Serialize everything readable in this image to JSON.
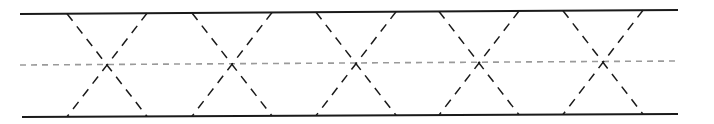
{
  "diagram": {
    "type": "truss-band-pattern",
    "width": 714,
    "height": 124,
    "colors": {
      "boundary": "#1a1a1a",
      "diagonal": "#1a1a1a",
      "centerline": "#9a9a9a",
      "background": "#ffffff"
    },
    "top_line": {
      "x1": 20,
      "y1": 14,
      "x2": 678,
      "y2": 10
    },
    "bottom_line": {
      "x1": 22,
      "y1": 117,
      "x2": 678,
      "y2": 114
    },
    "centerline": {
      "x1": 20,
      "y1": 65,
      "x2": 678,
      "y2": 61
    },
    "crossings": [
      107,
      232,
      356,
      479,
      603
    ],
    "half_span": 40
  }
}
